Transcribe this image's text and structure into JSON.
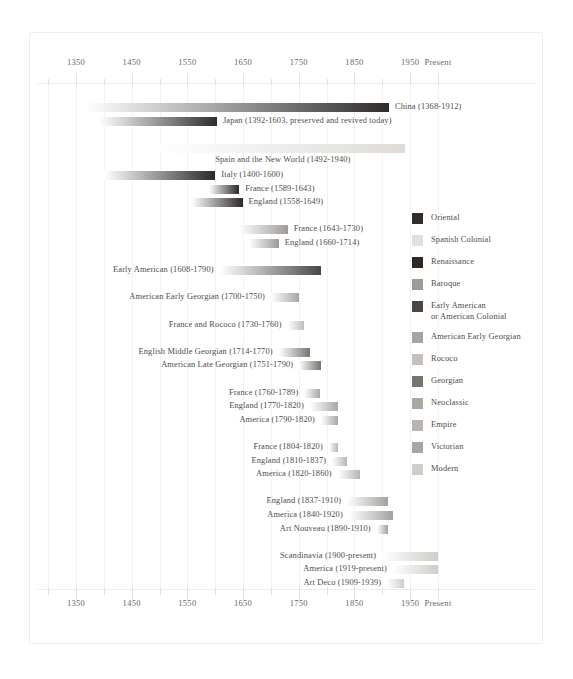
{
  "chart_data": {
    "type": "bar",
    "subtype": "horizontal-timeline-gantt",
    "title": "",
    "xlabel": "",
    "ylabel": "",
    "xlim": [
      1300,
      2000
    ],
    "x_present_year": 2000,
    "grid": true,
    "legend_position": "right",
    "axis": {
      "major_ticks": [
        {
          "year": 1350,
          "label": "1350"
        },
        {
          "year": 1450,
          "label": "1450"
        },
        {
          "year": 1550,
          "label": "1550"
        },
        {
          "year": 1650,
          "label": "1650"
        },
        {
          "year": 1750,
          "label": "1750"
        },
        {
          "year": 1850,
          "label": "1850"
        },
        {
          "year": 1950,
          "label": "1950"
        },
        {
          "year": 2000,
          "label": "Present"
        }
      ],
      "minor_ticks": [
        1300,
        1400,
        1500,
        1600,
        1700,
        1800,
        1900
      ],
      "duplicated_top_and_bottom": true
    },
    "categories": [
      "China (1368-1912)",
      "Japan (1392-1603, preserved and revived today)",
      "Spain and the New World (1492-1940)",
      "Italy (1400-1600)",
      "France (1589-1643)",
      "England (1558-1649)",
      "France (1643-1730)",
      "England (1660-1714)",
      "Early American (1608-1790)",
      "American Early Georgian  (1700-1750)",
      "France and Rococo (1730-1760)",
      "English Middle Georgian (1714-1770)",
      "American Late Georgian (1751-1790)",
      "France (1760-1789)",
      "England (1770-1820)",
      "America (1790-1820)",
      "France (1804-1820)",
      "England (1810-1837)",
      "America (1820-1860)",
      "England (1837-1910)",
      "America (1840-1920)",
      "Art Nouveau (1890-1910)",
      "Scandinavia (1900-present)",
      "America (1919-present)",
      "Art Deco (1909-1939)"
    ],
    "bars": [
      {
        "label": "China (1368-1912)",
        "start": 1368,
        "end": 1912,
        "style": "Oriental",
        "color": "#2f2c2a",
        "label_side": "right",
        "row": 0
      },
      {
        "label": "Japan (1392-1603, preserved and revived today)",
        "start": 1392,
        "end": 1603,
        "style": "Oriental",
        "color": "#2f2c2a",
        "label_side": "right",
        "row": 1
      },
      {
        "label": "Spain and the New World (1492-1940)",
        "start": 1492,
        "end": 1940,
        "style": "Spanish Colonial",
        "color": "#dedbd7",
        "label_side": "below",
        "row": 3
      },
      {
        "label": "Italy (1400-1600)",
        "start": 1400,
        "end": 1600,
        "style": "Renaissance",
        "color": "#2b2826",
        "label_side": "right",
        "row": 5
      },
      {
        "label": "France (1589-1643)",
        "start": 1589,
        "end": 1643,
        "style": "Renaissance",
        "color": "#2b2826",
        "label_side": "right",
        "row": 6
      },
      {
        "label": "England (1558-1649)",
        "start": 1558,
        "end": 1649,
        "style": "Renaissance",
        "color": "#2b2826",
        "label_side": "right",
        "row": 7
      },
      {
        "label": "France (1643-1730)",
        "start": 1643,
        "end": 1730,
        "style": "Baroque",
        "color": "#9d9a97",
        "label_side": "right",
        "row": 9
      },
      {
        "label": "England (1660-1714)",
        "start": 1660,
        "end": 1714,
        "style": "Baroque",
        "color": "#9d9a97",
        "label_side": "right",
        "row": 10
      },
      {
        "label": "Early American (1608-1790)",
        "start": 1608,
        "end": 1790,
        "style": "Early American or American Colonial",
        "color": "#4b4745",
        "label_side": "left",
        "row": 12
      },
      {
        "label": "American Early Georgian  (1700-1750)",
        "start": 1700,
        "end": 1750,
        "style": "American Early Georgian",
        "color": "#a7a4a0",
        "label_side": "left",
        "row": 14
      },
      {
        "label": "France and Rococo (1730-1760)",
        "start": 1730,
        "end": 1760,
        "style": "Rococo",
        "color": "#c0bdb9",
        "label_side": "left",
        "row": 16
      },
      {
        "label": "English Middle Georgian (1714-1770)",
        "start": 1714,
        "end": 1770,
        "style": "Georgian",
        "color": "#77736f",
        "label_side": "left",
        "row": 18
      },
      {
        "label": "American Late Georgian (1751-1790)",
        "start": 1751,
        "end": 1790,
        "style": "Georgian",
        "color": "#77736f",
        "label_side": "left",
        "row": 19
      },
      {
        "label": "France (1760-1789)",
        "start": 1760,
        "end": 1789,
        "style": "Neoclassic",
        "color": "#aaa7a3",
        "label_side": "left",
        "row": 21
      },
      {
        "label": "England (1770-1820)",
        "start": 1770,
        "end": 1820,
        "style": "Neoclassic",
        "color": "#aaa7a3",
        "label_side": "left",
        "row": 22
      },
      {
        "label": "America (1790-1820)",
        "start": 1790,
        "end": 1820,
        "style": "Neoclassic",
        "color": "#aaa7a3",
        "label_side": "left",
        "row": 23
      },
      {
        "label": "France (1804-1820)",
        "start": 1804,
        "end": 1820,
        "style": "Empire",
        "color": "#b8b5b1",
        "label_side": "left",
        "row": 25
      },
      {
        "label": "England (1810-1837)",
        "start": 1810,
        "end": 1837,
        "style": "Empire",
        "color": "#b8b5b1",
        "label_side": "left",
        "row": 26
      },
      {
        "label": "America (1820-1860)",
        "start": 1820,
        "end": 1860,
        "style": "Empire",
        "color": "#b8b5b1",
        "label_side": "left",
        "row": 27
      },
      {
        "label": "England (1837-1910)",
        "start": 1837,
        "end": 1910,
        "style": "Victorian",
        "color": "#a4a19d",
        "label_side": "left",
        "row": 29
      },
      {
        "label": "America (1840-1920)",
        "start": 1840,
        "end": 1920,
        "style": "Victorian",
        "color": "#a4a19d",
        "label_side": "left",
        "row": 30
      },
      {
        "label": "Art Nouveau (1890-1910)",
        "start": 1890,
        "end": 1910,
        "style": "Victorian",
        "color": "#a4a19d",
        "label_side": "left",
        "row": 31
      },
      {
        "label": "Scandinavia (1900-present)",
        "start": 1900,
        "end": 2000,
        "style": "Modern",
        "color": "#cfcdc9",
        "label_side": "left",
        "row": 33
      },
      {
        "label": "America (1919-present)",
        "start": 1919,
        "end": 2000,
        "style": "Modern",
        "color": "#cfcdc9",
        "label_side": "left",
        "row": 34
      },
      {
        "label": "Art Deco (1909-1939)",
        "start": 1909,
        "end": 1939,
        "style": "Modern",
        "color": "#cfcdc9",
        "label_side": "left",
        "row": 35
      }
    ],
    "legend": [
      {
        "label": "Oriental",
        "color": "#2f2c2a"
      },
      {
        "label": "Spanish Colonial",
        "color": "#e3e1de"
      },
      {
        "label": "Renaissance",
        "color": "#2b2826"
      },
      {
        "label": "Baroque",
        "color": "#9d9a97"
      },
      {
        "label": "Early American\nor American Colonial",
        "color": "#4b4745"
      },
      {
        "label": "American Early Georgian",
        "color": "#a7a4a0"
      },
      {
        "label": "Rococo",
        "color": "#c4c1bd"
      },
      {
        "label": "Georgian",
        "color": "#77736f"
      },
      {
        "label": "Neoclassic",
        "color": "#aaa7a3"
      },
      {
        "label": "Empire",
        "color": "#b8b5b1"
      },
      {
        "label": "Victorian",
        "color": "#a8a5a1"
      },
      {
        "label": "Modern",
        "color": "#cfcdc9"
      }
    ]
  }
}
